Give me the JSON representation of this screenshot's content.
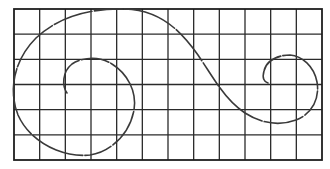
{
  "diagram": {
    "grid": {
      "left": 14,
      "top": 9,
      "right": 322,
      "bottom": 160,
      "columns": 12,
      "rows": 6,
      "line_color": "#2a2a2a"
    },
    "curve": {
      "color": "#3a3a3a",
      "path": "M67,93 C62,86 62,72 72,64 C82,57 100,56 112,64 C128,74 137,92 134,110 C130,132 112,152 90,155 C62,158 30,142 18,115 C8,90 14,60 36,38 C60,15 95,8 125,9 C160,10 180,30 198,55 C215,80 225,100 245,113 C262,124 280,126 296,120 C312,114 320,98 317,82 C314,66 302,56 290,55 C276,55 266,62 264,71 C262,78 264,82 268,83"
    }
  }
}
